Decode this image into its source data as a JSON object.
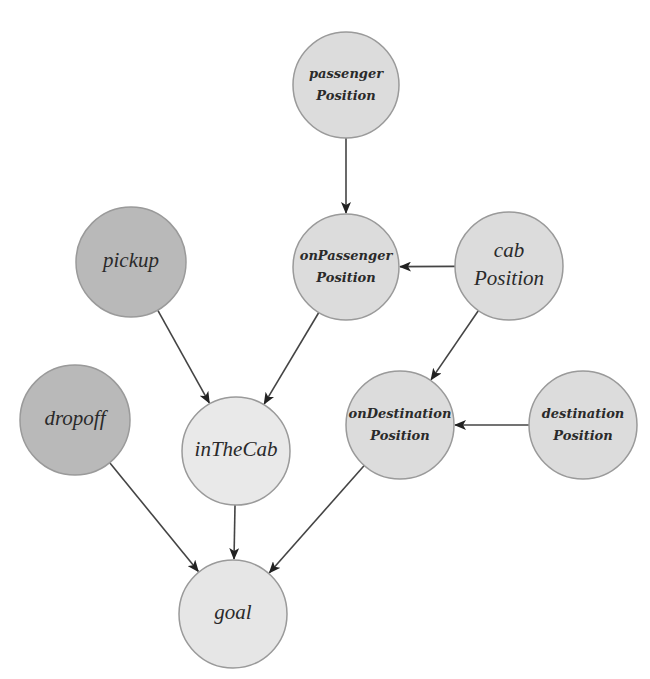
{
  "diagram": {
    "type": "directed-graph",
    "colors": {
      "background": "#ffffff",
      "observed_node_fill": "#b9b9b9",
      "latent_node_fill": "#dcdcdc",
      "inTheCab_fill": "#e9e9e9",
      "goal_fill": "#e6e6e6",
      "node_stroke": "#9a9a9a",
      "edge": "#444444"
    },
    "nodes": [
      {
        "id": "passengerPosition",
        "line1": "passenger",
        "line2": "Position",
        "cx": 346,
        "cy": 85,
        "r": 53,
        "fill": "#dcdcdc",
        "size": "small"
      },
      {
        "id": "onPassengerPosition",
        "line1": "onPassenger",
        "line2": "Position",
        "cx": 346,
        "cy": 267,
        "r": 53,
        "fill": "#dcdcdc",
        "size": "small"
      },
      {
        "id": "cabPosition",
        "line1": "cab",
        "line2": "Position",
        "cx": 509,
        "cy": 266,
        "r": 54,
        "fill": "#dcdcdc",
        "size": "medium"
      },
      {
        "id": "pickup",
        "line1": "pickup",
        "line2": "",
        "cx": 131,
        "cy": 262,
        "r": 55,
        "fill": "#b9b9b9",
        "size": "big"
      },
      {
        "id": "dropoff",
        "line1": "dropoff",
        "line2": "",
        "cx": 75,
        "cy": 420,
        "r": 55,
        "fill": "#b9b9b9",
        "size": "big"
      },
      {
        "id": "inTheCab",
        "line1": "inTheCab",
        "line2": "",
        "cx": 236,
        "cy": 451,
        "r": 54,
        "fill": "#e9e9e9",
        "size": "big"
      },
      {
        "id": "onDestinationPosition",
        "line1": "onDestination",
        "line2": "Position",
        "cx": 400,
        "cy": 425,
        "r": 54,
        "fill": "#dcdcdc",
        "size": "small"
      },
      {
        "id": "destinationPosition",
        "line1": "destination",
        "line2": "Position",
        "cx": 583,
        "cy": 425,
        "r": 54,
        "fill": "#dcdcdc",
        "size": "small"
      },
      {
        "id": "goal",
        "line1": "goal",
        "line2": "",
        "cx": 233,
        "cy": 614,
        "r": 54,
        "fill": "#e6e6e6",
        "size": "big"
      }
    ],
    "edges": [
      {
        "from": "passengerPosition",
        "to": "onPassengerPosition"
      },
      {
        "from": "cabPosition",
        "to": "onPassengerPosition"
      },
      {
        "from": "cabPosition",
        "to": "onDestinationPosition"
      },
      {
        "from": "destinationPosition",
        "to": "onDestinationPosition"
      },
      {
        "from": "pickup",
        "to": "inTheCab"
      },
      {
        "from": "onPassengerPosition",
        "to": "inTheCab"
      },
      {
        "from": "dropoff",
        "to": "goal"
      },
      {
        "from": "inTheCab",
        "to": "goal"
      },
      {
        "from": "onDestinationPosition",
        "to": "goal"
      }
    ]
  }
}
